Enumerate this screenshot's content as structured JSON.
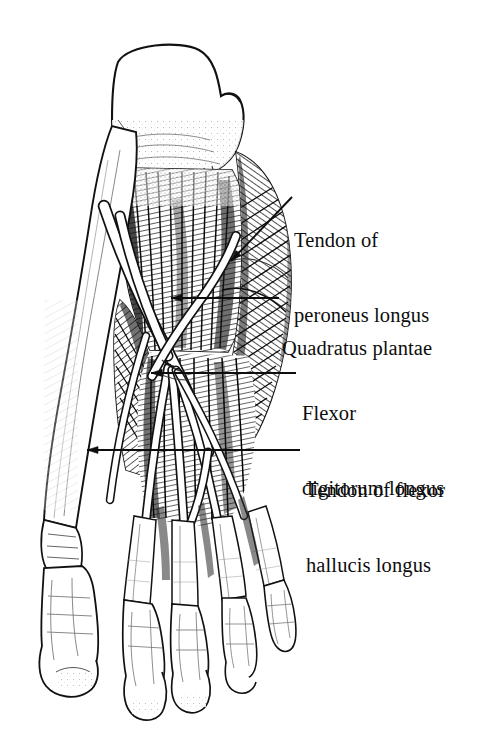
{
  "figure": {
    "kind": "anatomical-illustration",
    "view": "plantar (sole) view",
    "style": "black-and-white line engraving / stipple hatching",
    "background_color": "#ffffff",
    "ink_color": "#0d0d0d",
    "structures": [
      "calcaneus",
      "quadratus plantae",
      "flexor digitorum longus tendons",
      "flexor hallucis longus tendon",
      "tendon of peroneus longus",
      "metatarsal bones",
      "phalanges of the five toes"
    ]
  },
  "labels": [
    {
      "id": "peroneus",
      "name": "tendon-of-peroneus-longus",
      "line1": "Tendon of",
      "line2": "peroneus longus",
      "leader": {
        "type": "diagonal-arrow",
        "from_x": 292,
        "from_y": 197,
        "to_x": 231,
        "to_y": 261
      }
    },
    {
      "id": "quadratus",
      "name": "quadratus-plantae",
      "line1": "Quadratus plantae",
      "line2": "",
      "leader": {
        "type": "horizontal-arrow",
        "from_x": 279,
        "from_y": 298,
        "to_x": 171,
        "to_y": 298
      }
    },
    {
      "id": "flexor-digitorum",
      "name": "flexor-digitorum-longus",
      "line1": "Flexor",
      "line2": "digitorum longus",
      "leader": {
        "type": "horizontal-arrow",
        "from_x": 296,
        "from_y": 373,
        "to_x": 151,
        "to_y": 373
      }
    },
    {
      "id": "flexor-hallucis",
      "name": "tendon-of-flexor-hallucis-longus",
      "line1": "Tendon of flexor",
      "line2": "hallucis longus",
      "leader": {
        "type": "horizontal-arrow",
        "from_x": 300,
        "from_y": 450,
        "to_x": 87,
        "to_y": 450
      }
    }
  ]
}
